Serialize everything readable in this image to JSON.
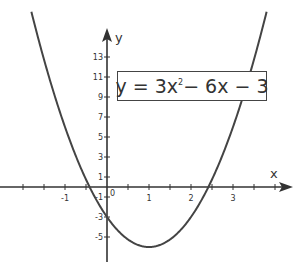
{
  "chart_data": {
    "type": "line",
    "title": "",
    "equation": "y = 3x² − 6x − 3",
    "equation_parts": {
      "lhs": "y = 3x",
      "exp": "2",
      "rhs": " − 6x − 3"
    },
    "coefficients": {
      "a": 3,
      "b": -6,
      "c": -3
    },
    "xlabel": "x",
    "ylabel": "y",
    "xlim": [
      -2.55,
      4.4
    ],
    "ylim": [
      -8.2,
      16.5
    ],
    "x_ticks": [
      -1,
      0,
      1,
      2,
      3
    ],
    "x_tick_labels": [
      "-1",
      "0",
      "1",
      "2",
      "3"
    ],
    "x_minor_step": 0.5,
    "y_ticks": [
      -5,
      -3,
      -1,
      1,
      3,
      5,
      7,
      9,
      11,
      13
    ],
    "y_tick_labels": [
      "-5",
      "-3",
      "-1",
      "1",
      "3",
      "5",
      "7",
      "9",
      "11",
      "13"
    ],
    "grid": false,
    "legend": "none",
    "series": [
      {
        "name": "y = 3x² − 6x − 3",
        "x": [
          -1.75,
          -1.5,
          -1,
          -0.5,
          -0.414,
          0,
          0.5,
          1,
          1.5,
          2,
          2.414,
          2.5,
          3,
          3.5,
          3.75
        ],
        "y": [
          16.69,
          12.75,
          6,
          0.75,
          0,
          -3,
          -5.25,
          -6,
          -5.25,
          -3,
          0,
          0.75,
          6,
          12.75,
          16.69
        ]
      }
    ],
    "key_points": {
      "vertex": [
        1,
        -6
      ],
      "y_intercept": [
        0,
        -3
      ],
      "roots": [
        -0.414,
        2.414
      ]
    },
    "colors": {
      "curve": "#444444",
      "axes": "#333333",
      "text": "#333333"
    }
  },
  "labels": {
    "x_axis": "x",
    "y_axis": "y",
    "origin": "0"
  }
}
